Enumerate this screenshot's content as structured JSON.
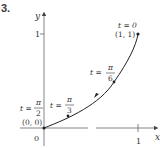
{
  "problem": {
    "number": "3."
  },
  "axes": {
    "x_label": "x",
    "y_label": "y",
    "origin_label": "0",
    "x_tick": "1",
    "y_tick": "1"
  },
  "points": [
    {
      "t": "t = 0",
      "coord": "(1, 1)"
    },
    {
      "t_num": "π",
      "t_den": "6",
      "t_prefix": "t ="
    },
    {
      "t_num": "π",
      "t_den": "3",
      "t_prefix": "t ="
    },
    {
      "t_num": "π",
      "t_den": "2",
      "t_prefix": "t =",
      "coord": "(0, 0)"
    }
  ],
  "colors": {
    "curve": "#222222",
    "axis": "#555555",
    "text": "#333333"
  }
}
